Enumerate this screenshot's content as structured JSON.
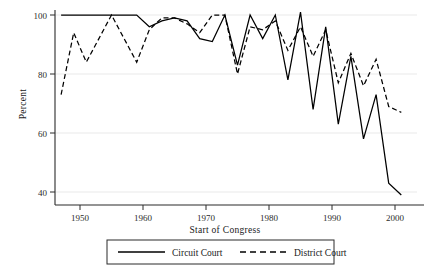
{
  "chart_data": {
    "type": "line",
    "title": "",
    "xlabel": "Start of Congress",
    "ylabel": "Percent",
    "xlim": [
      1946,
      2002
    ],
    "ylim": [
      36,
      101
    ],
    "xticks": [
      1950,
      1960,
      1970,
      1980,
      1990,
      2000
    ],
    "xtick_labels": [
      "1950",
      "1960",
      "1970",
      "1980",
      "1990",
      "2000"
    ],
    "yticks": [
      40,
      60,
      80,
      100
    ],
    "ytick_labels": [
      "40",
      "60",
      "80",
      "100"
    ],
    "grid": "horizontal",
    "legend_position": "below-axis-centered",
    "x": [
      1947,
      1949,
      1951,
      1953,
      1955,
      1957,
      1959,
      1961,
      1963,
      1965,
      1967,
      1969,
      1971,
      1973,
      1975,
      1977,
      1979,
      1981,
      1983,
      1985,
      1987,
      1989,
      1991,
      1993,
      1995,
      1997,
      1999,
      2001
    ],
    "series": [
      {
        "name": "Circuit Court",
        "style": "solid",
        "color": "#000000",
        "values": [
          100,
          100,
          100,
          100,
          100,
          100,
          100,
          96,
          98,
          99,
          98,
          92,
          91,
          100,
          83,
          100,
          92,
          100,
          78,
          101,
          68,
          96,
          63,
          86,
          58,
          73,
          43,
          39
        ]
      },
      {
        "name": "District Court",
        "style": "dashed",
        "color": "#000000",
        "values": [
          73,
          94,
          84,
          92,
          100,
          92,
          84,
          95,
          99,
          99,
          97,
          94,
          100,
          100,
          80,
          96,
          95,
          98,
          88,
          96,
          86,
          95,
          77,
          87,
          76,
          85,
          69,
          67
        ]
      }
    ]
  },
  "axis": {
    "ylabel": "Percent",
    "xlabel": "Start of Congress"
  },
  "legend": {
    "entries": [
      {
        "label": "Circuit Court",
        "style": "solid"
      },
      {
        "label": "District Court",
        "style": "dashed"
      }
    ]
  }
}
